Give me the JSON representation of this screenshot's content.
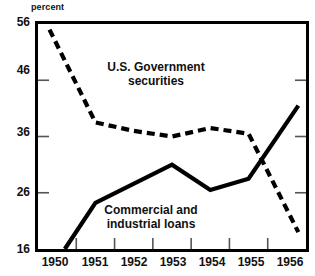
{
  "axis_unit_label": "percent",
  "annotations": {
    "govt_securities": "U.S. Government\nsecurities",
    "govt_securities_line1": "U.S. Government",
    "govt_securities_line2": "securities",
    "commercial_loans_line1": "Commercial and",
    "commercial_loans_line2": "industrial loans"
  },
  "chart_data": {
    "type": "line",
    "title": "",
    "subtitle": "",
    "xlabel": "",
    "ylabel": "percent",
    "ylim": [
      16,
      56
    ],
    "xlim": [
      1949.5,
      1956.5
    ],
    "grid": false,
    "legend_position": "inline-annotation",
    "yticks": [
      56,
      46,
      36,
      26,
      16
    ],
    "ytick_labels": [
      "56",
      "46",
      "36",
      "26",
      "16"
    ],
    "xticks": [
      1950,
      1951,
      1952,
      1953,
      1954,
      1955,
      1956
    ],
    "xtick_labels": [
      "1950",
      "1951",
      "1952",
      "1953",
      "1954",
      "1955",
      "1956"
    ],
    "series": [
      {
        "name": "U.S. Government securities",
        "style": "dashed",
        "color": "#000000",
        "x": [
          1949.8,
          1951.0,
          1952.0,
          1953.0,
          1954.0,
          1955.0,
          1956.3
        ],
        "values": [
          55.0,
          38.5,
          37.0,
          36.0,
          37.5,
          36.5,
          19.0
        ]
      },
      {
        "name": "Commercial and industrial loans",
        "style": "solid",
        "color": "#000000",
        "x": [
          1950.2,
          1951.0,
          1953.0,
          1954.0,
          1955.0,
          1956.3
        ],
        "values": [
          16.0,
          24.2,
          31.0,
          26.5,
          28.5,
          41.5
        ]
      }
    ]
  },
  "colors": {
    "ink": "#000000",
    "background": "#ffffff",
    "tick": "#555555"
  }
}
